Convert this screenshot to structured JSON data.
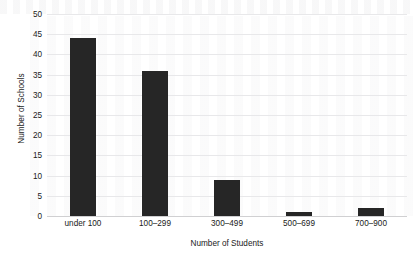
{
  "chart_data": {
    "type": "bar",
    "title": "",
    "subtitle": "",
    "categories": [
      "under 100",
      "100–299",
      "300–499",
      "500–699",
      "700–900"
    ],
    "values": [
      44,
      36,
      9,
      1,
      2
    ],
    "xlabel": "Number of Students",
    "ylabel": "Number of Schools",
    "ylim": [
      0,
      50
    ],
    "ytick_step": 5,
    "yticks": [
      0,
      5,
      10,
      15,
      20,
      25,
      30,
      35,
      40,
      45,
      50
    ],
    "ytick_labels": [
      "0",
      "5",
      "10",
      "15",
      "20",
      "25",
      "30",
      "35",
      "40",
      "45",
      "50"
    ],
    "grid": "horizontal",
    "legend": "none",
    "orientation": "vertical",
    "colors": {
      "bar": "#262626",
      "gridline": "#e8e8ea",
      "axis": "#d0d0d2",
      "text": "#1a1a1a",
      "background": "#ffffff"
    }
  }
}
